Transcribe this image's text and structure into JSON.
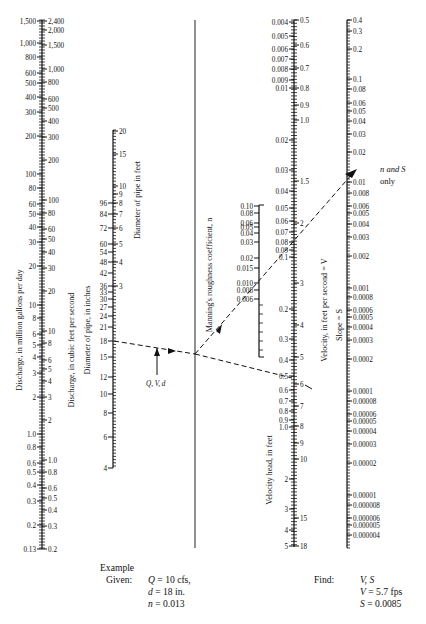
{
  "diagram": {
    "type": "nomograph",
    "center_line": {
      "x": 195,
      "y_top": 20,
      "y_bottom": 548
    },
    "scales": {
      "discharge_mgd": {
        "title": "Discharge, in million gallons per day",
        "ticks": [
          {
            "label": "1,500",
            "y": 21
          },
          {
            "label": "1,000",
            "y": 43
          },
          {
            "label": "800",
            "y": 57
          },
          {
            "label": "600",
            "y": 73
          },
          {
            "label": "500",
            "y": 83
          },
          {
            "label": "400",
            "y": 97
          },
          {
            "label": "300",
            "y": 112
          },
          {
            "label": "200",
            "y": 136
          },
          {
            "label": "100",
            "y": 174
          },
          {
            "label": "80",
            "y": 188
          },
          {
            "label": "60",
            "y": 204
          },
          {
            "label": "50",
            "y": 214
          },
          {
            "label": "40",
            "y": 227
          },
          {
            "label": "30",
            "y": 242
          },
          {
            "label": "20",
            "y": 266
          },
          {
            "label": "10",
            "y": 305
          },
          {
            "label": "8",
            "y": 318
          },
          {
            "label": "6",
            "y": 334
          },
          {
            "label": "5",
            "y": 345
          },
          {
            "label": "4",
            "y": 357
          },
          {
            "label": "3",
            "y": 373
          },
          {
            "label": "2",
            "y": 397
          },
          {
            "label": "1.0",
            "y": 434
          },
          {
            "label": "0.8",
            "y": 447
          },
          {
            "label": "0.6",
            "y": 463
          },
          {
            "label": "0.5",
            "y": 472
          },
          {
            "label": "0.4",
            "y": 485
          },
          {
            "label": "0.3",
            "y": 501
          },
          {
            "label": "0.2",
            "y": 525
          },
          {
            "label": "0.13",
            "y": 549
          }
        ]
      },
      "discharge_cfs": {
        "title": "Discharge, in cubic feet per second",
        "ticks": [
          {
            "label": "2,400",
            "y": 21
          },
          {
            "label": "2,000",
            "y": 30
          },
          {
            "label": "1,500",
            "y": 45
          },
          {
            "label": "1,000",
            "y": 69
          },
          {
            "label": "800",
            "y": 82
          },
          {
            "label": "600",
            "y": 99
          },
          {
            "label": "500",
            "y": 108
          },
          {
            "label": "400",
            "y": 121
          },
          {
            "label": "300",
            "y": 137
          },
          {
            "label": "200",
            "y": 160
          },
          {
            "label": "100",
            "y": 200
          },
          {
            "label": "80",
            "y": 213
          },
          {
            "label": "60",
            "y": 229
          },
          {
            "label": "50",
            "y": 239
          },
          {
            "label": "40",
            "y": 252
          },
          {
            "label": "30",
            "y": 268
          },
          {
            "label": "20",
            "y": 291
          },
          {
            "label": "10",
            "y": 331
          },
          {
            "label": "8",
            "y": 343
          },
          {
            "label": "6",
            "y": 360
          },
          {
            "label": "5",
            "y": 369
          },
          {
            "label": "4",
            "y": 381
          },
          {
            "label": "3",
            "y": 397
          },
          {
            "label": "2",
            "y": 420
          },
          {
            "label": "1.0",
            "y": 460
          },
          {
            "label": "0.8",
            "y": 472
          },
          {
            "label": "0.6",
            "y": 488
          },
          {
            "label": "0.5",
            "y": 498
          },
          {
            "label": "0.4",
            "y": 510
          },
          {
            "label": "0.3",
            "y": 526
          },
          {
            "label": "0.2",
            "y": 549
          }
        ]
      },
      "diameter_in": {
        "title": "Diameter of pipe, in inches",
        "ticks": [
          {
            "label": "96",
            "y": 203
          },
          {
            "label": "84",
            "y": 214
          },
          {
            "label": "72",
            "y": 228
          },
          {
            "label": "60",
            "y": 244
          },
          {
            "label": "54",
            "y": 252
          },
          {
            "label": "48",
            "y": 262
          },
          {
            "label": "42",
            "y": 273
          },
          {
            "label": "36",
            "y": 286
          },
          {
            "label": "33",
            "y": 292
          },
          {
            "label": "30",
            "y": 299
          },
          {
            "label": "27",
            "y": 307
          },
          {
            "label": "24",
            "y": 316
          },
          {
            "label": "21",
            "y": 327
          },
          {
            "label": "18",
            "y": 341
          },
          {
            "label": "15",
            "y": 357
          },
          {
            "label": "12",
            "y": 377
          },
          {
            "label": "10",
            "y": 394
          },
          {
            "label": "8",
            "y": 413
          },
          {
            "label": "6",
            "y": 437
          },
          {
            "label": "4",
            "y": 468
          }
        ]
      },
      "diameter_ft": {
        "title": "Diameter of pipe in feet",
        "ticks": [
          {
            "label": "20",
            "y": 131
          },
          {
            "label": "15",
            "y": 154
          },
          {
            "label": "10",
            "y": 186
          },
          {
            "label": "9",
            "y": 194
          },
          {
            "label": "8",
            "y": 203
          },
          {
            "label": "7",
            "y": 214
          },
          {
            "label": "6",
            "y": 228
          },
          {
            "label": "5",
            "y": 244
          },
          {
            "label": "4",
            "y": 262
          },
          {
            "label": "3",
            "y": 286
          }
        ]
      },
      "manning_n": {
        "title": "Manning's roughness coefficient, n",
        "ticks": [
          {
            "label": "0.10",
            "y": 206
          },
          {
            "label": "0.08",
            "y": 213
          },
          {
            "label": "0.06",
            "y": 223
          },
          {
            "label": "0.05",
            "y": 227
          },
          {
            "label": "0.04",
            "y": 233
          },
          {
            "label": "0.03",
            "y": 242
          },
          {
            "label": "0.02",
            "y": 258
          },
          {
            "label": "0.015",
            "y": 268
          },
          {
            "label": "0.010",
            "y": 283
          },
          {
            "label": "0.008",
            "y": 290
          },
          {
            "label": "0.006",
            "y": 299
          }
        ],
        "y_bottom": 357
      },
      "velocity_head": {
        "title": "Velocity head, in feet",
        "ticks": [
          {
            "label": "0.004",
            "y": 22
          },
          {
            "label": "0.005",
            "y": 36
          },
          {
            "label": "0.006",
            "y": 49
          },
          {
            "label": "0.007",
            "y": 59
          },
          {
            "label": "0.008",
            "y": 69
          },
          {
            "label": "0.009",
            "y": 80
          },
          {
            "label": "0.01",
            "y": 88
          },
          {
            "label": "0.02",
            "y": 140
          },
          {
            "label": "0.03",
            "y": 170
          },
          {
            "label": "0.04",
            "y": 191
          },
          {
            "label": "0.05",
            "y": 208
          },
          {
            "label": "0.06",
            "y": 221
          },
          {
            "label": "0.07",
            "y": 232
          },
          {
            "label": "0.08",
            "y": 242
          },
          {
            "label": "0.09",
            "y": 250
          },
          {
            "label": "0.1",
            "y": 257
          },
          {
            "label": "0.2",
            "y": 309
          },
          {
            "label": "0.3",
            "y": 339
          },
          {
            "label": "0.4",
            "y": 360
          },
          {
            "label": "0.5",
            "y": 376
          },
          {
            "label": "0.6",
            "y": 390
          },
          {
            "label": "0.7",
            "y": 401
          },
          {
            "label": "0.8",
            "y": 411
          },
          {
            "label": "0.9",
            "y": 420
          },
          {
            "label": "1.0",
            "y": 427
          },
          {
            "label": "2",
            "y": 479
          },
          {
            "label": "3",
            "y": 509
          },
          {
            "label": "4",
            "y": 530
          },
          {
            "label": "5",
            "y": 546
          }
        ]
      },
      "velocity_fps": {
        "title": "Velocity, in feet per second = V",
        "ticks": [
          {
            "label": "0.5",
            "y": 20
          },
          {
            "label": "0.6",
            "y": 45
          },
          {
            "label": "0.7",
            "y": 68
          },
          {
            "label": "0.8",
            "y": 88
          },
          {
            "label": "0.9",
            "y": 105
          },
          {
            "label": "1.0",
            "y": 120
          },
          {
            "label": "1.5",
            "y": 181
          },
          {
            "label": "2",
            "y": 223
          },
          {
            "label": "3",
            "y": 283
          },
          {
            "label": "4",
            "y": 325
          },
          {
            "label": "5",
            "y": 357
          },
          {
            "label": "6",
            "y": 384
          },
          {
            "label": "7",
            "y": 406
          },
          {
            "label": "8",
            "y": 426
          },
          {
            "label": "9",
            "y": 443
          },
          {
            "label": "10",
            "y": 459
          },
          {
            "label": "15",
            "y": 518
          },
          {
            "label": "18",
            "y": 546
          }
        ]
      },
      "slope": {
        "title": "Slope = S",
        "ticks": [
          {
            "label": "0.4",
            "y": 20
          },
          {
            "label": "0.3",
            "y": 31
          },
          {
            "label": "0.2",
            "y": 49
          },
          {
            "label": "0.1",
            "y": 79
          },
          {
            "label": "0.08",
            "y": 89
          },
          {
            "label": "0.06",
            "y": 103
          },
          {
            "label": "0.05",
            "y": 111
          },
          {
            "label": "0.04",
            "y": 121
          },
          {
            "label": "0.03",
            "y": 134
          },
          {
            "label": "0.02",
            "y": 152
          },
          {
            "label": "0.01",
            "y": 182
          },
          {
            "label": "0.008",
            "y": 193
          },
          {
            "label": "0.006",
            "y": 206
          },
          {
            "label": "0.005",
            "y": 213
          },
          {
            "label": "0.004",
            "y": 224
          },
          {
            "label": "0.003",
            "y": 237
          },
          {
            "label": "0.002",
            "y": 256
          },
          {
            "label": "0.001",
            "y": 288
          },
          {
            "label": "0.0008",
            "y": 297
          },
          {
            "label": "0.0006",
            "y": 310
          },
          {
            "label": "0.0005",
            "y": 317
          },
          {
            "label": "0.0004",
            "y": 327
          },
          {
            "label": "0.0003",
            "y": 340
          },
          {
            "label": "0.0002",
            "y": 359
          },
          {
            "label": "0.0001",
            "y": 391
          },
          {
            "label": "0.00008",
            "y": 401
          },
          {
            "label": "0.00006",
            "y": 414
          },
          {
            "label": "0.00005",
            "y": 421
          },
          {
            "label": "0.00004",
            "y": 431
          },
          {
            "label": "0.00003",
            "y": 444
          },
          {
            "label": "0.00002",
            "y": 463
          },
          {
            "label": "0.00001",
            "y": 495
          },
          {
            "label": "0.000008",
            "y": 505
          },
          {
            "label": "0.000006",
            "y": 518
          },
          {
            "label": "0.000005",
            "y": 525
          },
          {
            "label": "0.000004",
            "y": 535
          }
        ],
        "y_bottom": 548
      }
    },
    "annotations": {
      "qvd_label": "Q, V, d",
      "ns_label_line1": "n and S",
      "ns_label_line2": "only"
    }
  },
  "example": {
    "heading": "Example",
    "given_label": "Given:",
    "given_lines": [
      {
        "var": "Q",
        "rest": " = 10 cfs,"
      },
      {
        "var": "d",
        "rest": " = 18 in."
      },
      {
        "var": "n",
        "rest": " = 0.013"
      }
    ],
    "find_label": "Find:",
    "find_lines": [
      {
        "var": "V, S",
        "rest": ""
      },
      {
        "var": "V",
        "rest": " = 5.7 fps"
      },
      {
        "var": "S",
        "rest": " = 0.0085"
      }
    ]
  }
}
